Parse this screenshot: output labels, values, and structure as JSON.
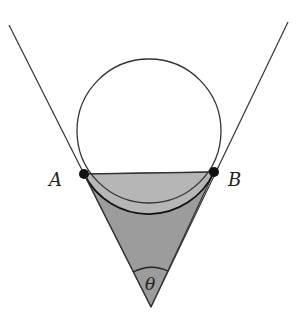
{
  "figure": {
    "width": 298,
    "height": 318,
    "labels": {
      "point_a": "A",
      "point_b": "B",
      "angle": "θ"
    },
    "colors": {
      "stroke": "#333333",
      "segment_fill": "#b6b6b6",
      "triangle_fill": "#9c9c9c",
      "point_fill": "#111111",
      "background": "#ffffff"
    },
    "geometry": {
      "circle_center": [
        149,
        131
      ],
      "circle_radius": 72,
      "point_a": [
        84,
        174
      ],
      "point_b": [
        214,
        172
      ],
      "apex": [
        151,
        307
      ],
      "left_tangent_start": [
        9,
        25
      ],
      "right_tangent_start": [
        288,
        22
      ]
    }
  }
}
